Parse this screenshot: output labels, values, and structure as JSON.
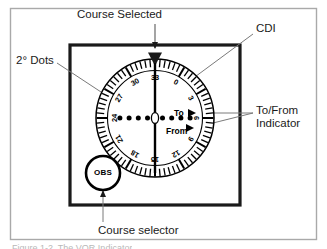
{
  "figure": {
    "domain": "diagram",
    "background_color": "#ffffff",
    "outer_border_color": "#a9a9a9",
    "instrument_border_color": "#1a1a1a",
    "ink_color": "#000000",
    "leader_color": "#808080"
  },
  "annotations": {
    "course_selected": "Course Selected",
    "cdi": "CDI",
    "dots": "2° Dots",
    "to_from_line1": "To/From",
    "to_from_line2": "Indicator",
    "course_selector": "Course selector"
  },
  "instrument": {
    "obs_knob_label": "OBS",
    "to_label": "To",
    "from_label": "From",
    "index_marker": "course-index-triangle",
    "selected_course": "30",
    "cdi_needle": "centered-vertical",
    "deviation_dots_left": 4,
    "deviation_dots_right": 4,
    "center_circle": "course-deviation-center",
    "tick_interval_degrees": 5,
    "number_interval_degrees": 30,
    "rose_numbers": [
      "0",
      "3",
      "6",
      "9",
      "12",
      "15",
      "18",
      "21",
      "24",
      "27",
      "30",
      "33"
    ],
    "rose_number_headings": [
      0,
      30,
      60,
      90,
      120,
      150,
      180,
      210,
      240,
      270,
      300,
      330
    ]
  },
  "caption": {
    "partial_text": "Figure 1-2. The VOR Indicator"
  }
}
